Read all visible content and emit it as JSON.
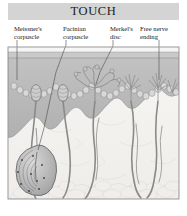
{
  "figure": {
    "title": "TOUCH",
    "title_band_color": "#d4d4d4",
    "border_color": "#9a9a9a",
    "background_color": "#ffffff"
  },
  "labels": [
    {
      "id": "meissner",
      "text": "Meissner's\ncorpuscle",
      "leader": "line-to-meissner-corpuscle"
    },
    {
      "id": "pacinian",
      "text": "Pacinian\ncorpuscle",
      "leader": "line-to-pacinian-corpuscle"
    },
    {
      "id": "merkel",
      "text": "Merkel's\ndisc",
      "leader": "line-to-merkel-disc"
    },
    {
      "id": "free_nerve",
      "text": "Free nerve\nending",
      "leader": "line-to-free-nerve-ending"
    }
  ],
  "illustration": {
    "description": "cross-section-of-skin-with-touch-receptors",
    "layers": [
      {
        "name": "stratum-corneum",
        "color": "#c9c9c9"
      },
      {
        "name": "epidermis",
        "color": "#b9b9b9"
      },
      {
        "name": "dermis",
        "color": "#f4f3f1"
      },
      {
        "name": "adipose-tissue",
        "color": "#eceae7"
      }
    ],
    "structures": [
      {
        "name": "meissner-corpuscle",
        "type": "oval-lamellated-receptor"
      },
      {
        "name": "pacinian-corpuscle",
        "type": "onion-layered-oval-receptor"
      },
      {
        "name": "merkel-disc",
        "type": "branched-disc-ending"
      },
      {
        "name": "free-nerve-ending",
        "type": "spiky-branched-ending"
      },
      {
        "name": "nerve-fiber",
        "type": "descending-axon"
      }
    ],
    "nerve_color": "#8a8a8a"
  }
}
